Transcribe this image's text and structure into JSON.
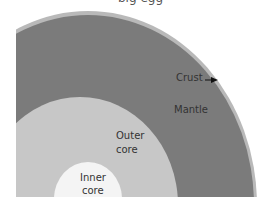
{
  "diagram": {
    "title_cropped": "big egg",
    "layers": [
      {
        "name": "crust",
        "label": "Crust",
        "color": "#b9b9b9"
      },
      {
        "name": "mantle",
        "label": "Mantle",
        "color": "#7b7b7b"
      },
      {
        "name": "outer-core",
        "label_line1": "Outer",
        "label_line2": "core",
        "color": "#c7c7c7"
      },
      {
        "name": "inner-core",
        "label_line1": "Inner",
        "label_line2": "core",
        "color": "#f4f4f4"
      }
    ]
  }
}
